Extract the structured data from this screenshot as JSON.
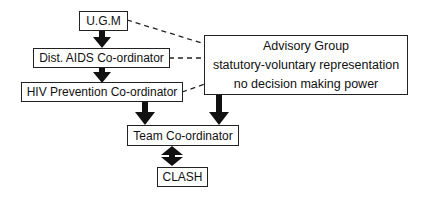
{
  "diagram": {
    "nodes": {
      "ugm": "U.G.M",
      "dist_aids": "Dist. AIDS Co-ordinator",
      "hiv_prevention": "HIV Prevention Co-ordinator",
      "team": "Team Co-ordinator",
      "clash": "CLASH",
      "advisory": {
        "title": "Advisory Group",
        "line2": "statutory-voluntary representation",
        "line3": "no decision making power"
      }
    },
    "edges": [
      {
        "from": "U.G.M",
        "to": "Dist. AIDS Co-ordinator",
        "style": "solid-arrow"
      },
      {
        "from": "Dist. AIDS Co-ordinator",
        "to": "HIV Prevention Co-ordinator",
        "style": "solid-arrow"
      },
      {
        "from": "HIV Prevention Co-ordinator",
        "to": "Team Co-ordinator",
        "style": "solid-arrow"
      },
      {
        "from": "Advisory Group",
        "to": "Team Co-ordinator",
        "style": "solid-arrow"
      },
      {
        "from": "Team Co-ordinator",
        "to": "CLASH",
        "style": "double-arrow"
      },
      {
        "from": "U.G.M",
        "to": "Advisory Group",
        "style": "dashed"
      },
      {
        "from": "Dist. AIDS Co-ordinator",
        "to": "Advisory Group",
        "style": "dashed"
      },
      {
        "from": "HIV Prevention Co-ordinator",
        "to": "Advisory Group",
        "style": "dashed"
      }
    ]
  }
}
